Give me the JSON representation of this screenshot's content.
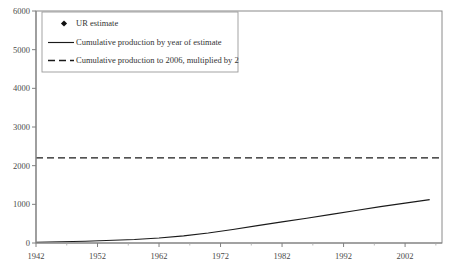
{
  "chart_data": {
    "type": "scatter",
    "title": "",
    "xlabel": "",
    "ylabel": "",
    "xlim": [
      1942,
      2008
    ],
    "ylim": [
      0,
      6000
    ],
    "grid": false,
    "legend_position": "top-left",
    "xticks": [
      1942,
      1952,
      1962,
      1972,
      1982,
      1992,
      2002
    ],
    "xtick_labels": [
      "1942",
      "1952",
      "1962",
      "1972",
      "1982",
      "1992",
      "2002"
    ],
    "xminor_ticks": [
      1947,
      1957,
      1967,
      1977,
      1987,
      1997,
      2007
    ],
    "yticks": [
      0,
      1000,
      2000,
      3000,
      4000,
      5000,
      6000
    ],
    "ytick_labels": [
      "0",
      "1000",
      "2000",
      "3000",
      "4000",
      "5000",
      "6000"
    ],
    "series": [
      {
        "name": "UR estimate",
        "type": "scatter",
        "marker": "diamond",
        "color": "#111111",
        "points": [
          [
            1942,
            600
          ],
          [
            1946,
            400
          ],
          [
            1946,
            310
          ],
          [
            1948,
            600
          ],
          [
            1950,
            1270
          ],
          [
            1953,
            900
          ],
          [
            1956,
            1000
          ],
          [
            1958,
            1250
          ],
          [
            1959,
            3000
          ],
          [
            1961,
            1500
          ],
          [
            1962,
            2000
          ],
          [
            1963,
            1250
          ],
          [
            1965,
            2500
          ],
          [
            1966,
            2100
          ],
          [
            1967,
            1800
          ],
          [
            1967,
            3350
          ],
          [
            1968,
            2100
          ],
          [
            1969,
            1650
          ],
          [
            1969,
            2800
          ],
          [
            1970,
            1450
          ],
          [
            1970,
            1200
          ],
          [
            1971,
            1900
          ],
          [
            1971,
            2000
          ],
          [
            1972,
            4000
          ],
          [
            1972,
            2050
          ],
          [
            1972,
            1700
          ],
          [
            1973,
            1900
          ],
          [
            1973,
            2100
          ],
          [
            1973,
            1450
          ],
          [
            1974,
            2100
          ],
          [
            1974,
            2600
          ],
          [
            1974,
            1800
          ],
          [
            1975,
            5950
          ],
          [
            1975,
            2200
          ],
          [
            1975,
            1950
          ],
          [
            1975,
            1600
          ],
          [
            1976,
            5550
          ],
          [
            1976,
            2250
          ],
          [
            1976,
            2000
          ],
          [
            1976,
            1500
          ],
          [
            1977,
            3200
          ],
          [
            1977,
            2300
          ],
          [
            1977,
            2100
          ],
          [
            1977,
            1900
          ],
          [
            1978,
            2200
          ],
          [
            1978,
            2000
          ],
          [
            1978,
            1600
          ],
          [
            1979,
            2500
          ],
          [
            1979,
            2150
          ],
          [
            1979,
            1900
          ],
          [
            1980,
            2800
          ],
          [
            1980,
            2250
          ],
          [
            1980,
            1950
          ],
          [
            1981,
            2300
          ],
          [
            1981,
            2100
          ],
          [
            1981,
            1600
          ],
          [
            1982,
            3000
          ],
          [
            1982,
            2200
          ],
          [
            1982,
            1800
          ],
          [
            1983,
            2150
          ],
          [
            1983,
            1700
          ],
          [
            1984,
            2050
          ],
          [
            1985,
            1700
          ],
          [
            1986,
            2100
          ],
          [
            1986,
            1700
          ],
          [
            1988,
            1750
          ],
          [
            1989,
            2050
          ],
          [
            1990,
            1700
          ],
          [
            1991,
            2750
          ],
          [
            1991,
            2600
          ],
          [
            1992,
            1800
          ],
          [
            1993,
            2900
          ],
          [
            1993,
            2100
          ],
          [
            1993,
            2200
          ],
          [
            1994,
            2150
          ],
          [
            1994,
            1750
          ],
          [
            1994,
            2900
          ],
          [
            1995,
            2450
          ],
          [
            1995,
            2200
          ],
          [
            1995,
            1700
          ],
          [
            1996,
            2150
          ],
          [
            1996,
            1550
          ],
          [
            1996,
            2800
          ],
          [
            1997,
            1800
          ],
          [
            1997,
            1900
          ],
          [
            1998,
            1900
          ],
          [
            1999,
            3050
          ],
          [
            1999,
            2100
          ],
          [
            2000,
            2000
          ],
          [
            2001,
            1750
          ],
          [
            2002,
            2700
          ],
          [
            2002,
            4000
          ],
          [
            2003,
            1900
          ],
          [
            2004,
            2000
          ],
          [
            2004,
            1850
          ],
          [
            2005,
            3700
          ],
          [
            2005,
            3200
          ],
          [
            2005,
            1900
          ],
          [
            2005,
            1800
          ]
        ]
      },
      {
        "name": "Cumulative production by year of estimate",
        "type": "line",
        "style": "solid",
        "color": "#1a1a1a",
        "points": [
          [
            1942,
            20
          ],
          [
            1950,
            45
          ],
          [
            1958,
            90
          ],
          [
            1962,
            130
          ],
          [
            1966,
            185
          ],
          [
            1970,
            260
          ],
          [
            1974,
            350
          ],
          [
            1978,
            450
          ],
          [
            1982,
            545
          ],
          [
            1986,
            640
          ],
          [
            1990,
            740
          ],
          [
            1994,
            840
          ],
          [
            1998,
            940
          ],
          [
            2002,
            1030
          ],
          [
            2006,
            1120
          ]
        ]
      },
      {
        "name": "Cumulative production to 2006, multiplied by 2",
        "type": "line",
        "style": "dashed",
        "color": "#1a1a1a",
        "constant_value": 2200,
        "points": [
          [
            1942,
            2200
          ],
          [
            2008,
            2200
          ]
        ]
      }
    ]
  },
  "legend": {
    "items": [
      {
        "label": "UR estimate",
        "symbol": "diamond"
      },
      {
        "label": "Cumulative production by year of estimate",
        "symbol": "solid-line"
      },
      {
        "label": "Cumulative production to 2006, multiplied by 2",
        "symbol": "dashed-line"
      }
    ]
  }
}
